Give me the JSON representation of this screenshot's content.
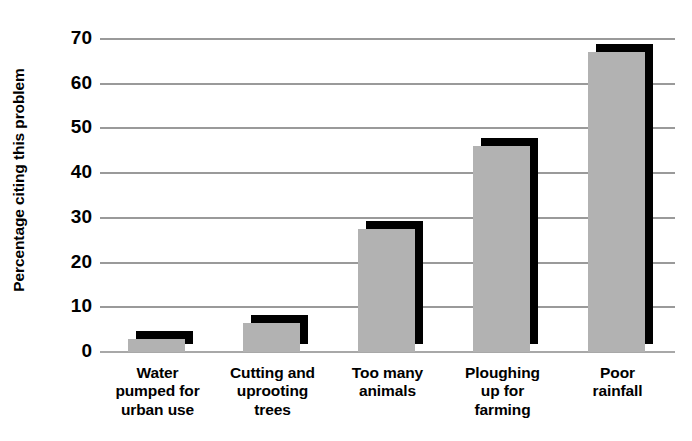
{
  "chart_data": {
    "type": "bar",
    "title": "",
    "xlabel": "",
    "ylabel": "Percentage citing this problem",
    "categories": [
      "Water\npumped for\nurban use",
      "Cutting and\nuprooting\ntrees",
      "Too many\nanimals",
      "Ploughing\nup for\nfarming",
      "Poor\nrainfall"
    ],
    "category_lines": [
      [
        "Water",
        "pumped for",
        "urban use"
      ],
      [
        "Cutting and",
        "uprooting",
        "trees"
      ],
      [
        "Too many",
        "animals"
      ],
      [
        "Ploughing",
        "up for",
        "farming"
      ],
      [
        "Poor",
        "rainfall"
      ]
    ],
    "values": [
      3,
      6.5,
      27.5,
      46,
      67
    ],
    "ylim": [
      0,
      70
    ],
    "ytick_labels": [
      "70",
      "60",
      "50",
      "40",
      "30",
      "20",
      "10",
      "0"
    ],
    "ytick_values": [
      70,
      60,
      50,
      40,
      30,
      20,
      10,
      0
    ],
    "grid": true,
    "legend": "none",
    "colors": {
      "bar_fill": "#b2b2b2",
      "bar_shadow": "#000000",
      "gridline": "#9a9a9a",
      "text": "#000000",
      "background": "#ffffff"
    }
  }
}
